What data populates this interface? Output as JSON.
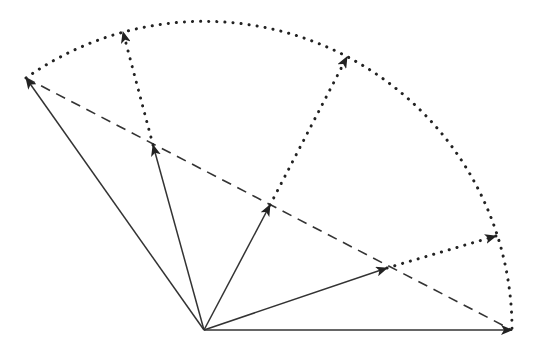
{
  "diagram": {
    "title": "",
    "colors": {
      "background": "#ffffff",
      "stroke": "#222222"
    },
    "origin": [
      204,
      330
    ],
    "arc": {
      "radius": 308,
      "style": "dotted",
      "from": [
        26,
        78
      ],
      "to": [
        512,
        330
      ]
    },
    "chord": {
      "style": "dashed",
      "from": [
        26,
        78
      ],
      "to": [
        512,
        330
      ]
    },
    "vectors": [
      {
        "name": "start-vector",
        "to": [
          26,
          78
        ]
      },
      {
        "name": "lerp-vector-1",
        "to": [
          153,
          145
        ]
      },
      {
        "name": "lerp-vector-2",
        "to": [
          270,
          205
        ]
      },
      {
        "name": "lerp-vector-3",
        "to": [
          387,
          268
        ]
      },
      {
        "name": "end-vector",
        "to": [
          512,
          330
        ]
      }
    ],
    "projections": [
      {
        "name": "projection-1",
        "from": [
          153,
          145
        ],
        "to": [
          123,
          32
        ]
      },
      {
        "name": "projection-2",
        "from": [
          270,
          205
        ],
        "to": [
          347,
          57
        ]
      },
      {
        "name": "projection-3",
        "from": [
          387,
          268
        ],
        "to": [
          496,
          236
        ]
      }
    ]
  }
}
